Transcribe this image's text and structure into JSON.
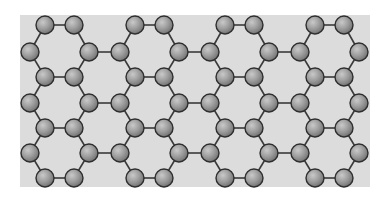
{
  "diagram": {
    "type": "honeycomb-lattice",
    "colors": {
      "page_background": "#ffffff",
      "panel_background": "#dcdcdc",
      "bond": "#3a3a3a",
      "atom_fill_light": "#b8b8b8",
      "atom_fill_dark": "#7a7a7a",
      "atom_stroke": "#2e2e2e"
    },
    "panel": {
      "x": 20,
      "y": 15,
      "width": 350,
      "height": 172
    },
    "atom_radius": 9,
    "period_x": 90,
    "columns": 4,
    "ring_rows": 4,
    "origin_x": 30,
    "ring_y": [
      25,
      77,
      128,
      178
    ],
    "side_y": [
      52,
      103,
      153
    ]
  }
}
